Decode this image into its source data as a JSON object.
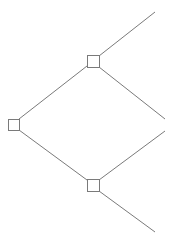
{
  "diagram": {
    "type": "decision-tree",
    "stroke_color": "#7a7a7a",
    "node_fill": "#ffffff",
    "nodes": [
      {
        "id": "root",
        "shape": "square",
        "x": 8,
        "y": 119,
        "size": 11
      },
      {
        "id": "upper",
        "shape": "square",
        "x": 87,
        "y": 55,
        "size": 12
      },
      {
        "id": "lower",
        "shape": "square",
        "x": 87,
        "y": 179,
        "size": 12
      }
    ],
    "edges": [
      {
        "from": "root",
        "to": "upper",
        "x1": 19,
        "y1": 119,
        "x2": 87,
        "y2": 66
      },
      {
        "from": "root",
        "to": "lower",
        "x1": 19,
        "y1": 130,
        "x2": 87,
        "y2": 180
      },
      {
        "from": "upper",
        "to": "branch-1",
        "x1": 99,
        "y1": 56,
        "x2": 155,
        "y2": 12
      },
      {
        "from": "upper",
        "to": "branch-2",
        "x1": 99,
        "y1": 67,
        "x2": 165,
        "y2": 119
      },
      {
        "from": "lower",
        "to": "branch-3",
        "x1": 99,
        "y1": 180,
        "x2": 165,
        "y2": 131
      },
      {
        "from": "lower",
        "to": "branch-4",
        "x1": 99,
        "y1": 191,
        "x2": 155,
        "y2": 232
      }
    ]
  }
}
